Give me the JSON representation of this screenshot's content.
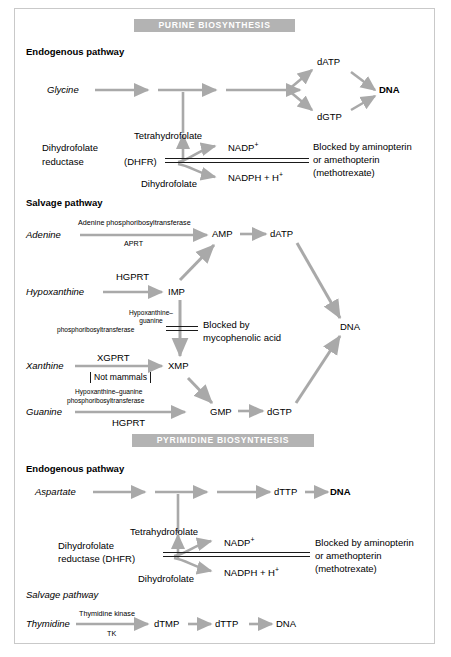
{
  "figure": {
    "banners": {
      "purine": "PURINE  BIOSYNTHESIS",
      "pyrimidine": "PYRIMIDINE  BIOSYNTHESIS"
    },
    "section_headings": {
      "purine_endogenous": "Endogenous pathway",
      "purine_salvage": "Salvage pathway",
      "pyrimidine_endogenous": "Endogenous pathway",
      "pyrimidine_salvage": "Salvage pathway"
    },
    "purine_endogenous": {
      "substrate": "Glycine",
      "node_datp": "dATP",
      "node_dgtp": "dGTP",
      "node_dna": "DNA",
      "enzyme_line1": "Dihydrofolate",
      "enzyme_line2": "reductase",
      "enzyme_abbrev": "(DHFR)",
      "cofactor_top": "Tetrahydrofolate",
      "cofactor_bottom": "Dihydrofolate",
      "nadp": "NADP",
      "nadp_sup": "+",
      "nadph": "NADPH  +  H",
      "nadph_sup": "+",
      "blocked_line1": "Blocked by aminopterin",
      "blocked_line2": "or amethopterin",
      "blocked_line3": "(methotrexate)"
    },
    "purine_salvage": {
      "adenine": {
        "substrate": "Adenine",
        "enzyme_full": "Adenine phosphoribosyltransferase",
        "enzyme_abbrev": "APRT",
        "product": "AMP",
        "next": "dATP"
      },
      "hypoxanthine": {
        "substrate": "Hypoxanthine",
        "enzyme_abbrev": "HGPRT",
        "product": "IMP"
      },
      "imp_to_xmp": {
        "enzyme_l1": "Hypoxanthine–",
        "enzyme_l2": "guanine",
        "enzyme_l3": "phosphoribosyltransferase",
        "blocked_l1": "Blocked by",
        "blocked_l2": "mycophenolic  acid",
        "product": "XMP"
      },
      "xanthine": {
        "substrate": "Xanthine",
        "enzyme_abbrev": "XGPRT",
        "note": "Not mammals"
      },
      "guanine": {
        "substrate": "Guanine",
        "enzyme_l1": "Hypoxanthine–guanine",
        "enzyme_l2": "phosphoribosyltransferase",
        "enzyme_abbrev": "HGPRT",
        "product": "GMP",
        "next": "dGTP"
      },
      "node_dna": "DNA"
    },
    "pyrimidine_endogenous": {
      "substrate": "Aspartate",
      "node_dttp": "dTTP",
      "node_dna": "DNA",
      "enzyme_line1": "Dihydrofolate",
      "enzyme_line2": "reductase (DHFR)",
      "cofactor_top": "Tetrahydrofolate",
      "cofactor_bottom": "Dihydrofolate",
      "nadp": "NADP",
      "nadp_sup": "+",
      "nadph": "NADPH  +  H",
      "nadph_sup": "+",
      "blocked_line1": "Blocked by aminopterin",
      "blocked_line2": "or amethopterin",
      "blocked_line3": "(methotrexate)"
    },
    "pyrimidine_salvage": {
      "substrate": "Thymidine",
      "enzyme_full": "Thymidine kinase",
      "enzyme_abbrev": "TK",
      "node_dtmp": "dTMP",
      "node_dttp": "dTTP",
      "node_dna": "DNA"
    },
    "colors": {
      "arrow": "#a9a9a9",
      "banner_bg": "#b3b3b3",
      "banner_text": "#ffffff",
      "text": "#000000",
      "frame_border": "#c9c9c9"
    }
  }
}
